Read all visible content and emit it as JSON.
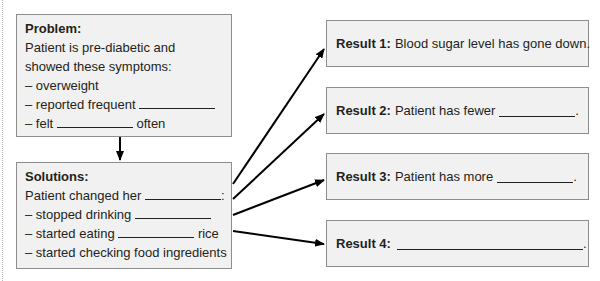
{
  "problem": {
    "heading": "Problem:",
    "lines": [
      "Patient is pre-diabetic and",
      "showed these symptoms:",
      "– overweight",
      "– reported frequent",
      "– felt",
      "often"
    ]
  },
  "solutions": {
    "heading": "Solutions:",
    "lines": [
      "Patient changed her",
      ":",
      "– stopped drinking",
      "– started eating",
      "rice",
      "– started checking food ingredients"
    ]
  },
  "results": [
    {
      "label": "Result 1:",
      "text": "Blood sugar level has gone down."
    },
    {
      "label": "Result 2:",
      "text": "Patient has fewer",
      "suffix": "."
    },
    {
      "label": "Result 3:",
      "text": "Patient has more",
      "suffix": "."
    },
    {
      "label": "Result 4:",
      "text": "",
      "suffix": "."
    }
  ],
  "colors": {
    "box_fill": "#f1f1f1",
    "box_border": "#8d8d8d",
    "arrow": "#000000",
    "text": "#231f20"
  }
}
